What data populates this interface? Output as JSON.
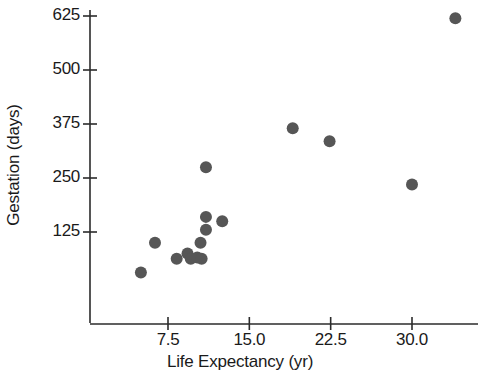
{
  "chart_data": {
    "type": "scatter",
    "title": "",
    "xlabel": "Life Expectancy (yr)",
    "ylabel": "Gestation (days)",
    "xlim": [
      3.0,
      35.5
    ],
    "ylim": [
      0,
      660
    ],
    "xticks": [
      7.5,
      15.0,
      22.5,
      30.0
    ],
    "xtick_labels": [
      "7.5",
      "15.0",
      "22.5",
      "30.0"
    ],
    "yticks": [
      125,
      250,
      375,
      500,
      625
    ],
    "ytick_labels": [
      "125",
      "250",
      "375",
      "500",
      "625"
    ],
    "grid": false,
    "legend": null,
    "marker_color": "#565656",
    "axis_color": "#2b2b2b",
    "background_color": "#ffffff",
    "points": [
      {
        "x": 5.0,
        "y": 31
      },
      {
        "x": 6.3,
        "y": 100
      },
      {
        "x": 8.3,
        "y": 63
      },
      {
        "x": 9.3,
        "y": 75
      },
      {
        "x": 9.6,
        "y": 63
      },
      {
        "x": 10.2,
        "y": 66
      },
      {
        "x": 10.5,
        "y": 100
      },
      {
        "x": 10.6,
        "y": 63
      },
      {
        "x": 11.0,
        "y": 275
      },
      {
        "x": 11.0,
        "y": 160
      },
      {
        "x": 11.0,
        "y": 130
      },
      {
        "x": 12.5,
        "y": 150
      },
      {
        "x": 19.0,
        "y": 365
      },
      {
        "x": 22.4,
        "y": 335
      },
      {
        "x": 30.0,
        "y": 235
      },
      {
        "x": 34.0,
        "y": 620
      }
    ]
  },
  "axes": {
    "x_title": "Life Expectancy (yr)",
    "y_title": "Gestation (days)"
  }
}
